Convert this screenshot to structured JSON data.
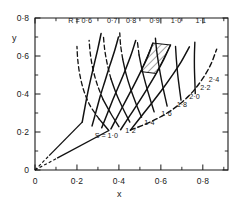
{
  "figure": {
    "type": "curvilinear-grid-chart",
    "axis_label_x": "x",
    "axis_label_y": "y"
  },
  "chart_data": {
    "type": "line",
    "title": "",
    "subtitle": "",
    "xlabel": "x",
    "ylabel": "y",
    "xlim": [
      0,
      0.92
    ],
    "ylim": [
      0,
      0.8
    ],
    "grid": false,
    "legend": "none",
    "annotations": [
      {
        "text": "R = 0·6",
        "x": 0.215,
        "y": 0.772,
        "name": "label-R-0-6"
      },
      {
        "text": "0·7",
        "x": 0.368,
        "y": 0.772,
        "name": "label-R-0-7"
      },
      {
        "text": "0·8",
        "x": 0.458,
        "y": 0.772,
        "name": "label-R-0-8"
      },
      {
        "text": "0·9",
        "x": 0.57,
        "y": 0.772,
        "name": "label-R-0-9"
      },
      {
        "text": "1·0",
        "x": 0.672,
        "y": 0.772,
        "name": "label-R-1-0"
      },
      {
        "text": "1·1",
        "x": 0.79,
        "y": 0.772,
        "name": "label-R-1-1"
      },
      {
        "text": "S = 1·0",
        "x": 0.34,
        "y": 0.17,
        "name": "label-S-1-0"
      },
      {
        "text": "1·2",
        "x": 0.455,
        "y": 0.196,
        "name": "label-S-1-2"
      },
      {
        "text": "1·4",
        "x": 0.545,
        "y": 0.238,
        "name": "label-S-1-4"
      },
      {
        "text": "1·6",
        "x": 0.627,
        "y": 0.285,
        "name": "label-S-1-6"
      },
      {
        "text": "1·8",
        "x": 0.7,
        "y": 0.33,
        "name": "label-S-1-8"
      },
      {
        "text": "2·0",
        "x": 0.76,
        "y": 0.375,
        "name": "label-S-2-0"
      },
      {
        "text": "2·2",
        "x": 0.812,
        "y": 0.42,
        "name": "label-S-2-2"
      },
      {
        "text": "2·4",
        "x": 0.853,
        "y": 0.462,
        "name": "label-S-2-4"
      }
    ],
    "x_ticks_major": [
      0,
      0.2,
      0.4,
      0.6,
      0.8
    ],
    "x_ticklabels": [
      "0",
      "0·2",
      "0·4",
      "0·6",
      "0·8"
    ],
    "x_ticks_minor": [
      0.1,
      0.3,
      0.5,
      0.7,
      0.9
    ],
    "y_ticks_major": [
      0,
      0.2,
      0.4,
      0.6,
      0.8
    ],
    "y_ticklabels": [
      "0",
      "0·2",
      "0·4",
      "0·6",
      "0·8"
    ],
    "y_ticks_minor": [
      0.1,
      0.3,
      0.5,
      0.7
    ],
    "families": [
      {
        "name": "R",
        "label_prefix": "R = ",
        "values": [
          0.6,
          0.7,
          0.8,
          0.9,
          1.0,
          1.1
        ],
        "style": "solid",
        "description": "constant-R curves running bottom-left to top"
      },
      {
        "name": "S",
        "label_prefix": "S = ",
        "values": [
          1.0,
          1.2,
          1.4,
          1.6,
          1.8,
          2.0,
          2.2,
          2.4
        ],
        "style": "solid-right-dashed-left",
        "description": "constant-S curves fanning from the lower-left vertex"
      }
    ],
    "curves_R": [
      {
        "value": 0.6,
        "points": [
          [
            0.225,
            0.252
          ],
          [
            0.238,
            0.33
          ],
          [
            0.252,
            0.41
          ],
          [
            0.268,
            0.49
          ],
          [
            0.284,
            0.565
          ],
          [
            0.3,
            0.64
          ],
          [
            0.315,
            0.718
          ]
        ]
      },
      {
        "value": 0.7,
        "points": [
          [
            0.272,
            0.232
          ],
          [
            0.292,
            0.312
          ],
          [
            0.312,
            0.392
          ],
          [
            0.334,
            0.47
          ],
          [
            0.356,
            0.548
          ],
          [
            0.378,
            0.622
          ],
          [
            0.398,
            0.7
          ]
        ]
      },
      {
        "value": 0.8,
        "points": [
          [
            0.318,
            0.222
          ],
          [
            0.346,
            0.3
          ],
          [
            0.374,
            0.378
          ],
          [
            0.404,
            0.455
          ],
          [
            0.432,
            0.53
          ],
          [
            0.458,
            0.606
          ],
          [
            0.48,
            0.682
          ]
        ]
      },
      {
        "value": 0.9,
        "points": [
          [
            0.362,
            0.216
          ],
          [
            0.398,
            0.292
          ],
          [
            0.434,
            0.368
          ],
          [
            0.47,
            0.443
          ],
          [
            0.504,
            0.518
          ],
          [
            0.536,
            0.592
          ],
          [
            0.562,
            0.668
          ]
        ]
      },
      {
        "value": 1.0,
        "points": [
          [
            0.408,
            0.212
          ],
          [
            0.452,
            0.286
          ],
          [
            0.496,
            0.36
          ],
          [
            0.538,
            0.434
          ],
          [
            0.578,
            0.508
          ],
          [
            0.614,
            0.582
          ],
          [
            0.646,
            0.658
          ]
        ]
      },
      {
        "value": 1.1,
        "points": [
          [
            0.455,
            0.21
          ],
          [
            0.506,
            0.282
          ],
          [
            0.558,
            0.354
          ],
          [
            0.608,
            0.426
          ],
          [
            0.654,
            0.498
          ],
          [
            0.698,
            0.572
          ],
          [
            0.736,
            0.648
          ]
        ]
      }
    ],
    "curves_S": [
      {
        "value": 1.0,
        "points": [
          [
            0.352,
            0.208
          ],
          [
            0.306,
            0.268
          ],
          [
            0.262,
            0.34
          ],
          [
            0.232,
            0.42
          ],
          [
            0.214,
            0.5
          ],
          [
            0.204,
            0.578
          ],
          [
            0.2,
            0.65
          ]
        ]
      },
      {
        "value": 1.2,
        "points": [
          [
            0.4,
            0.228
          ],
          [
            0.362,
            0.296
          ],
          [
            0.324,
            0.372
          ],
          [
            0.296,
            0.452
          ],
          [
            0.276,
            0.532
          ],
          [
            0.264,
            0.61
          ],
          [
            0.258,
            0.682
          ]
        ]
      },
      {
        "value": 1.4,
        "points": [
          [
            0.452,
            0.252
          ],
          [
            0.42,
            0.322
          ],
          [
            0.388,
            0.4
          ],
          [
            0.362,
            0.48
          ],
          [
            0.344,
            0.56
          ],
          [
            0.332,
            0.636
          ],
          [
            0.326,
            0.706
          ]
        ]
      },
      {
        "value": 1.6,
        "points": [
          [
            0.508,
            0.278
          ],
          [
            0.482,
            0.348
          ],
          [
            0.456,
            0.426
          ],
          [
            0.434,
            0.506
          ],
          [
            0.418,
            0.584
          ],
          [
            0.408,
            0.658
          ],
          [
            0.404,
            0.722
          ]
        ]
      },
      {
        "value": 1.8,
        "points": [
          [
            0.568,
            0.306
          ],
          [
            0.548,
            0.376
          ],
          [
            0.528,
            0.452
          ],
          [
            0.51,
            0.53
          ],
          [
            0.496,
            0.606
          ],
          [
            0.488,
            0.676
          ]
        ]
      },
      {
        "value": 2.0,
        "points": [
          [
            0.63,
            0.336
          ],
          [
            0.616,
            0.404
          ],
          [
            0.602,
            0.478
          ],
          [
            0.59,
            0.554
          ],
          [
            0.58,
            0.628
          ],
          [
            0.574,
            0.694
          ]
        ]
      },
      {
        "value": 2.2,
        "points": [
          [
            0.696,
            0.368
          ],
          [
            0.688,
            0.434
          ],
          [
            0.68,
            0.506
          ],
          [
            0.674,
            0.58
          ],
          [
            0.67,
            0.65
          ]
        ]
      },
      {
        "value": 2.4,
        "points": [
          [
            0.764,
            0.402
          ],
          [
            0.762,
            0.466
          ],
          [
            0.76,
            0.536
          ],
          [
            0.76,
            0.606
          ],
          [
            0.762,
            0.672
          ]
        ]
      }
    ],
    "boundary_rays": [
      {
        "name": "upper-ray",
        "from": [
          0.0,
          0.0
        ],
        "to": [
          0.225,
          0.252
        ],
        "dashed_near_origin": true
      },
      {
        "name": "lower-ray",
        "from": [
          0.0,
          0.0
        ],
        "to": [
          0.352,
          0.208
        ],
        "dashed_near_origin": true
      }
    ],
    "outer_arc": {
      "name": "outer-boundary-arc",
      "points": [
        [
          0.455,
          0.21
        ],
        [
          0.56,
          0.258
        ],
        [
          0.655,
          0.318
        ],
        [
          0.735,
          0.392
        ],
        [
          0.795,
          0.474
        ],
        [
          0.838,
          0.556
        ],
        [
          0.866,
          0.636
        ]
      ]
    },
    "hatched_region": {
      "name": "hatched-cell",
      "fill": "diagonal-hatch",
      "polygon": [
        [
          0.504,
          0.518
        ],
        [
          0.562,
          0.668
        ],
        [
          0.646,
          0.658
        ],
        [
          0.578,
          0.508
        ]
      ]
    },
    "colors": {
      "ink": "#1a1a1a",
      "background": "#ffffff",
      "curve": "#111111",
      "hatch": "#333333"
    }
  }
}
